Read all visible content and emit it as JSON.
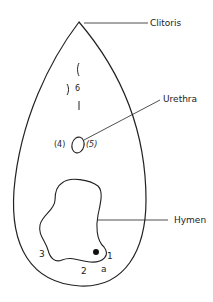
{
  "labels": {
    "clitoris": "Clitoris",
    "urethra": "Urethra",
    "hymen": "Hymen"
  },
  "markers": {
    "six": "6",
    "four": "(4)",
    "five": "(5)",
    "one": "1",
    "two": "2",
    "three": "3",
    "a": "a"
  },
  "colors": {
    "stroke": "#222222",
    "background": "#ffffff"
  }
}
